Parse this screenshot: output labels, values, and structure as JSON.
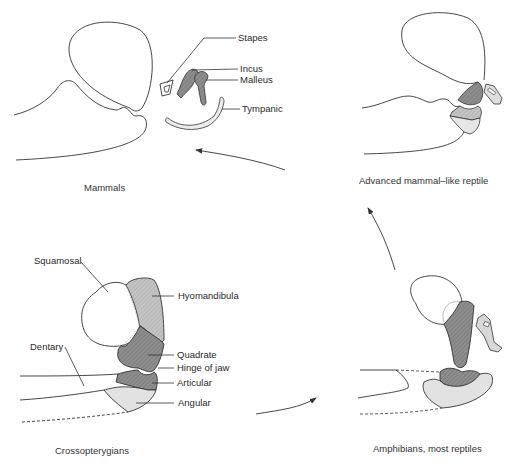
{
  "figure": {
    "panels": [
      {
        "caption": "Mammals",
        "labels": [
          "Stapes",
          "Incus",
          "Malleus",
          "Tympanic"
        ]
      },
      {
        "caption": "Advanced mammal–like reptile",
        "labels": []
      },
      {
        "caption": "Crossopterygians",
        "labels": [
          "Squamosal",
          "Hyomandibula",
          "Dentary",
          "Quadrate",
          "Hinge of jaw",
          "Articular",
          "Angular"
        ]
      },
      {
        "caption": "Amphibians, most reptiles",
        "labels": []
      }
    ],
    "arrows": [
      {
        "from": "Crossopterygians",
        "to": "Amphibians, most reptiles"
      },
      {
        "from": "Amphibians, most reptiles",
        "to": "Advanced mammal–like reptile"
      },
      {
        "from": "Advanced mammal–like reptile",
        "to": "Mammals"
      }
    ],
    "colors": {
      "stroke": "#333333",
      "dark_fill": "#8a8a8a",
      "mid_fill": "#b4b4b4",
      "light_fill": "#e2e2e2",
      "background": "#ffffff"
    }
  }
}
